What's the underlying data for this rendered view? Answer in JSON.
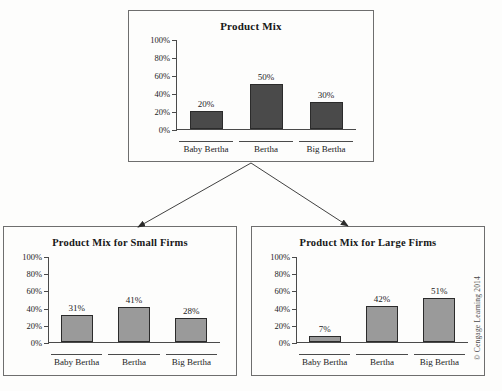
{
  "page": {
    "background_color": "#fdfdfc",
    "copyright": "© Cengage Learning 2014"
  },
  "colors": {
    "bar_fill_top": "#4a4a4a",
    "bar_fill_bottom": "#9a9a9a",
    "bar_border": "#2b2b2b",
    "axis": "#4a4a4a",
    "box_border": "#6e6e6e",
    "text": "#1c1c1c"
  },
  "diagram": {
    "arrows": [
      {
        "name": "arrow-to-small-firms",
        "from_x": 251,
        "from_y": 163,
        "to_x": 138,
        "to_y": 227
      },
      {
        "name": "arrow-to-large-firms",
        "from_x": 251,
        "from_y": 163,
        "to_x": 348,
        "to_y": 226
      }
    ]
  },
  "chart_data": [
    {
      "id": "product-mix",
      "type": "bar",
      "title": "Product Mix",
      "categories": [
        "Baby Bertha",
        "Bertha",
        "Big Bertha"
      ],
      "values": [
        20,
        50,
        30
      ],
      "value_labels": [
        "20%",
        "50%",
        "30%"
      ],
      "xlabel": "",
      "ylabel": "",
      "ylim": [
        0,
        100
      ],
      "yticks": [
        0,
        20,
        40,
        60,
        80,
        100
      ],
      "ytick_labels": [
        "0%",
        "20%",
        "40%",
        "60%",
        "80%",
        "100%"
      ],
      "grid": false,
      "legend": false,
      "bar_color": "#4a4a4a"
    },
    {
      "id": "product-mix-small-firms",
      "type": "bar",
      "title": "Product Mix for Small Firms",
      "categories": [
        "Baby Bertha",
        "Bertha",
        "Big Bertha"
      ],
      "values": [
        31,
        41,
        28
      ],
      "value_labels": [
        "31%",
        "41%",
        "28%"
      ],
      "xlabel": "",
      "ylabel": "",
      "ylim": [
        0,
        100
      ],
      "yticks": [
        0,
        20,
        40,
        60,
        80,
        100
      ],
      "ytick_labels": [
        "0%",
        "20%",
        "40%",
        "60%",
        "80%",
        "100%"
      ],
      "grid": false,
      "legend": false,
      "bar_color": "#9a9a9a"
    },
    {
      "id": "product-mix-large-firms",
      "type": "bar",
      "title": "Product Mix for Large Firms",
      "categories": [
        "Baby Bertha",
        "Bertha",
        "Big Bertha"
      ],
      "values": [
        7,
        42,
        51
      ],
      "value_labels": [
        "7%",
        "42%",
        "51%"
      ],
      "xlabel": "",
      "ylabel": "",
      "ylim": [
        0,
        100
      ],
      "yticks": [
        0,
        20,
        40,
        60,
        80,
        100
      ],
      "ytick_labels": [
        "0%",
        "20%",
        "40%",
        "60%",
        "80%",
        "100%"
      ],
      "grid": false,
      "legend": false,
      "bar_color": "#9a9a9a"
    }
  ]
}
